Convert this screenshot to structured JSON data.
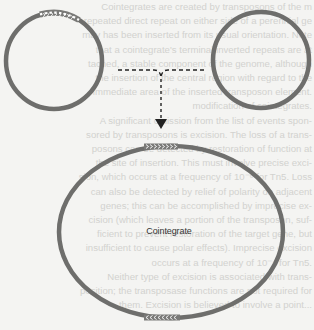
{
  "figure": {
    "type": "transposition-cointegrate-diagram",
    "label_cointegrate": "Cointegrate",
    "colors": {
      "background": "#f4f4f2",
      "ring": "#6e6e6c",
      "transposon_fill": "#7a7a78",
      "transposon_chevron": "#ffffff",
      "arrow": "#222222",
      "bleed_text": "#d2d2cf"
    },
    "elements": {
      "donor_plasmid": {
        "description": "left circle with transposon segment",
        "transposon_direction": "right"
      },
      "target_plasmid": {
        "description": "right circle without transposon"
      },
      "fusion_arrow": {
        "style": "dashed",
        "direction": "down"
      },
      "cointegrate": {
        "description": "large ring with two transposon copies",
        "top_transposon_direction": "right",
        "bottom_transposon_direction": "left"
      }
    },
    "chevrons": {
      "right": "›››››››",
      "left": "‹‹‹‹‹‹‹‹"
    }
  },
  "bleed_through_text": [
    "Cointegrates are created by transposons of the m",
    "repeated direct repeat on either side of a perennial ge",
    "may has been inserted from its usual orientation. Note",
    "that a cointegrate's terminal inverted repeats are at",
    "tached, a stable component of the genome, although",
    "the insertion of the central region with regard to the",
    "immediate area of the inserted transposon element.",
    "modification of cointegrates.",
    "  A significant omission from the list of events spon-",
    "sored by transposons is excision. The loss of a trans-",
    "posons can be detected by restoration of function at",
    "the site of insertion. This must involve precise exci-",
    "sion, which occurs at a frequency of 10⁻⁶ for Tn5. Loss",
    "can also be detected by relief of polarity on adjacent",
    "genes; this can be accomplished by imprecise ex-",
    "cision (which leaves a portion of the transposon, suf-",
    "ficient to prevent restoration of the target gene, but",
    "insufficient to cause polar effects). Imprecise excision",
    "occurs at a frequency of 10⁻⁴ for Tn5.",
    "  Neither type of excision is associated with trans-",
    "position; the transposase functions are not required for",
    "them. Excision is believed to involve a point..."
  ]
}
